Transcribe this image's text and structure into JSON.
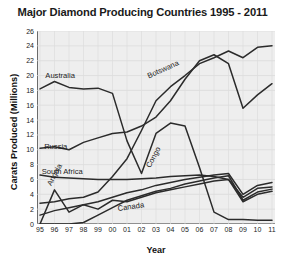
{
  "chart_data": {
    "type": "line",
    "title": "Major Diamond Producing Countries 1995 - 2011",
    "xlabel": "Year",
    "ylabel": "Carats Produced (Millions)",
    "x": [
      "95",
      "96",
      "97",
      "98",
      "99",
      "00",
      "01",
      "02",
      "03",
      "04",
      "05",
      "06",
      "07",
      "08",
      "09",
      "10",
      "11"
    ],
    "x_full": [
      1995,
      1996,
      1997,
      1998,
      1999,
      2000,
      2001,
      2002,
      2003,
      2004,
      2005,
      2006,
      2007,
      2008,
      2009,
      2010,
      2011
    ],
    "ylim": [
      0,
      26
    ],
    "yticks": [
      0,
      2,
      4,
      6,
      8,
      10,
      12,
      14,
      16,
      18,
      20,
      22,
      24,
      26
    ],
    "xlim_labels": [
      "95",
      "11"
    ],
    "grid": true,
    "legend": "inline-labels",
    "line_color": "#2b2b2b",
    "plot_background": "#eeeeee",
    "series": [
      {
        "name": "Botswana",
        "label_x_year": "01",
        "values": [
          16.8,
          17.7,
          20.1,
          20.0,
          21.1,
          24.6,
          26.4,
          28.4,
          30.4,
          31.1,
          31.9,
          34.3,
          33.6,
          32.6,
          17.7,
          22.0,
          22.9
        ],
        "values_plotted": [
          2.8,
          3.0,
          3.4,
          3.6,
          4.3,
          6.4,
          8.8,
          12.6,
          16.6,
          18.5,
          20.0,
          21.6,
          22.4,
          23.3,
          22.4,
          23.8,
          24.0
        ]
      },
      {
        "name": "Australia",
        "label_x_year": "97",
        "values_plotted": [
          18.2,
          19.2,
          18.4,
          18.2,
          18.3,
          17.6,
          11.2,
          6.8,
          12.2,
          13.6,
          13.2,
          7.6,
          1.6,
          0.6,
          0.6,
          0.5,
          0.5
        ]
      },
      {
        "name": "Russia",
        "label_x_year": "98",
        "values_plotted": [
          10.2,
          10.4,
          10.0,
          11.0,
          11.6,
          12.2,
          12.4,
          13.2,
          14.4,
          16.6,
          19.5,
          22.0,
          22.8,
          21.6,
          15.6,
          17.4,
          18.9
        ]
      },
      {
        "name": "South Africa",
        "label_x_year": "97",
        "values_plotted": [
          6.6,
          6.3,
          6.2,
          6.1,
          6.0,
          6.0,
          6.0,
          6.1,
          6.2,
          6.4,
          6.5,
          6.6,
          6.4,
          6.0,
          3.6,
          4.8,
          5.0
        ]
      },
      {
        "name": "Congo",
        "label_x_year": "04",
        "values_plotted": [
          1.2,
          1.8,
          2.2,
          2.6,
          3.0,
          3.6,
          4.2,
          4.6,
          5.2,
          5.6,
          6.0,
          6.3,
          6.6,
          6.8,
          4.0,
          5.2,
          5.6
        ]
      },
      {
        "name": "Angola",
        "label_x_year": "95",
        "values_plotted": [
          0.0,
          4.6,
          1.6,
          2.6,
          2.0,
          3.2,
          3.0,
          3.6,
          4.2,
          4.6,
          5.0,
          5.4,
          5.8,
          6.0,
          3.0,
          4.0,
          4.4
        ]
      },
      {
        "name": "Canada",
        "label_x_year": "02",
        "values_plotted": [
          0.0,
          0.0,
          0.0,
          0.2,
          1.2,
          2.2,
          3.2,
          3.8,
          4.4,
          4.8,
          5.4,
          5.8,
          6.2,
          6.5,
          3.2,
          4.3,
          4.7
        ]
      }
    ],
    "annotations": [
      {
        "text": "Botswana",
        "x": 0.46,
        "y": 0.215,
        "rotate": -24
      },
      {
        "text": "Australia",
        "x": 0.035,
        "y": 0.205,
        "rotate": 0
      },
      {
        "text": "Russia",
        "x": 0.03,
        "y": 0.575,
        "rotate": 0
      },
      {
        "text": "South Africa",
        "x": 0.02,
        "y": 0.705,
        "rotate": 0
      },
      {
        "text": "Congo",
        "x": 0.45,
        "y": 0.695,
        "rotate": -62
      },
      {
        "text": "Angola",
        "x": 0.035,
        "y": 0.79,
        "rotate": -62
      },
      {
        "text": "Canada",
        "x": 0.335,
        "y": 0.895,
        "rotate": -8
      }
    ]
  }
}
